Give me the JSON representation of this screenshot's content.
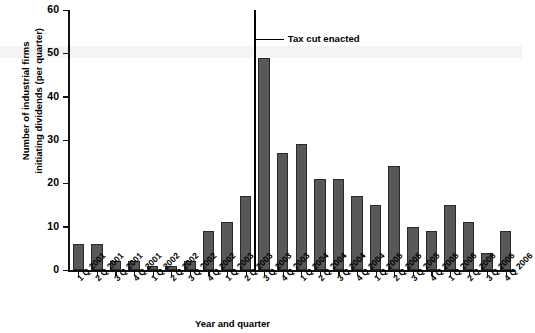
{
  "chart_data": {
    "type": "bar",
    "title": "",
    "xlabel": "Year and quarter",
    "ylabel": "Number of industrial firms initiating dividends (per quarter)",
    "ylabel_line1": "Number of industrial firms",
    "ylabel_line2": "initiating dividends (per quarter)",
    "ylim": [
      0,
      60
    ],
    "ytick_labels": [
      "0",
      "10",
      "20",
      "30",
      "40",
      "50",
      "60"
    ],
    "yticks": [
      0,
      10,
      20,
      30,
      40,
      50,
      60
    ],
    "grid": false,
    "legend": "none",
    "bar_color": "#585858",
    "bar_edge_color": "#2a2a2a",
    "categories": [
      "1 Q 2001",
      "2 Q 2001",
      "3 Q 2001",
      "4 Q 2001",
      "1 Q 2002",
      "2 Q 2002",
      "3 Q 2002",
      "4 Q 2002",
      "1 Q 2003",
      "2 Q 2003",
      "3 Q 2003",
      "4 Q 2003",
      "1 Q 2004",
      "2 Q 2004",
      "3 Q 2004",
      "4 Q 2004",
      "1 Q 2005",
      "2 Q 2005",
      "3 Q 2005",
      "4 Q 2005",
      "1 Q 2006",
      "2 Q 2006",
      "3 Q 2006",
      "4 Q 2006"
    ],
    "values": [
      6,
      6,
      2,
      2,
      1,
      1,
      2,
      9,
      11,
      17,
      49,
      27,
      29,
      21,
      21,
      17,
      15,
      24,
      10,
      9,
      15,
      11,
      4,
      9
    ],
    "annotations": [
      {
        "label": "Tax cut enacted",
        "type": "vertical-line-with-leader",
        "at_category_boundary": "between 2 Q 2003 and 3 Q 2003",
        "line_color": "#000000"
      }
    ]
  }
}
